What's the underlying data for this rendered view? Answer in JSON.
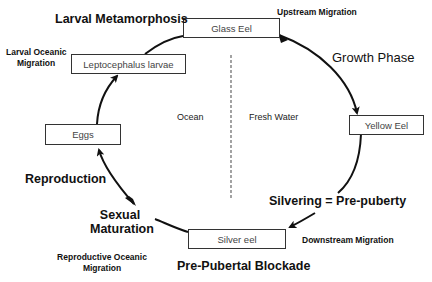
{
  "diagram": {
    "stages": {
      "glass_eel": "Glass Eel",
      "leptocephalus": "Leptocephalus larvae",
      "eggs": "Eggs",
      "yellow_eel": "Yellow Eel",
      "silver_eel": "Silver eel"
    },
    "phases": {
      "larval_metamorphosis": "Larval Metamorphosis",
      "growth_phase": "Growth Phase",
      "silvering": "Silvering = Pre-puberty",
      "pre_pubertal_blockade": "Pre-Pubertal Blockade",
      "sexual_maturation_line1": "Sexual",
      "sexual_maturation_line2": "Maturation",
      "reproduction": "Reproduction"
    },
    "migrations": {
      "upstream": "Upstream Migration",
      "downstream": "Downstream Migration",
      "larval_oceanic_line1": "Larval Oceanic",
      "larval_oceanic_line2": "Migration",
      "reproductive_oceanic_line1": "Reproductive Oceanic",
      "reproductive_oceanic_line2": "Migration"
    },
    "regions": {
      "ocean": "Ocean",
      "fresh_water": "Fresh Water"
    },
    "colors": {
      "line": "#111111",
      "box_border": "#333333",
      "box_text": "#444444",
      "divider": "#666666"
    }
  }
}
